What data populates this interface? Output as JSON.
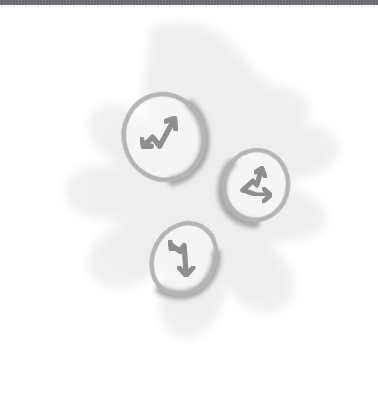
{
  "canvas": {
    "width": 378,
    "height": 400,
    "background_color": "#ffffff",
    "style": "hand-drawn pencil sketch illustration"
  },
  "top_bar": {
    "color": "#6e7073",
    "height_px": 5,
    "label": "window title bar strip"
  },
  "illustration": {
    "title": "Three sketched coins with zigzag trend arrows on a soft blob background",
    "blob": {
      "name": "background-blob",
      "fill_color": "#f1f1f2",
      "description": "irregular splat / star-like soft gray shape filling the center of the canvas"
    },
    "coins": [
      {
        "id": "coin-up-right",
        "label": "coin with upward zigzag arrow",
        "center": {
          "x": 164,
          "y": 137
        },
        "radius_x": 41,
        "radius_y": 44,
        "rotation_deg": -16,
        "outline_color": "#b4b4b4",
        "shadow_color": "#9a9a9a",
        "fill_color": "#fbfbfb",
        "arrow": {
          "name": "zigzag-arrow-up-icon",
          "direction": "up-right",
          "stroke_color": "#8e8e8e"
        }
      },
      {
        "id": "coin-right",
        "label": "coin with rightward zigzag arrow",
        "center": {
          "x": 256,
          "y": 185
        },
        "radius_x": 33,
        "radius_y": 36,
        "rotation_deg": 8,
        "outline_color": "#b4b4b4",
        "shadow_color": "#9a9a9a",
        "fill_color": "#fbfbfb",
        "arrow": {
          "name": "zigzag-arrow-right-icon",
          "direction": "right",
          "stroke_color": "#8e8e8e"
        }
      },
      {
        "id": "coin-down",
        "label": "coin with downward zigzag arrow",
        "center": {
          "x": 184,
          "y": 259
        },
        "radius_x": 32,
        "radius_y": 38,
        "rotation_deg": 28,
        "outline_color": "#b4b4b4",
        "shadow_color": "#9a9a9a",
        "fill_color": "#fbfbfb",
        "arrow": {
          "name": "zigzag-arrow-down-icon",
          "direction": "down",
          "stroke_color": "#8e8e8e"
        }
      }
    ]
  }
}
